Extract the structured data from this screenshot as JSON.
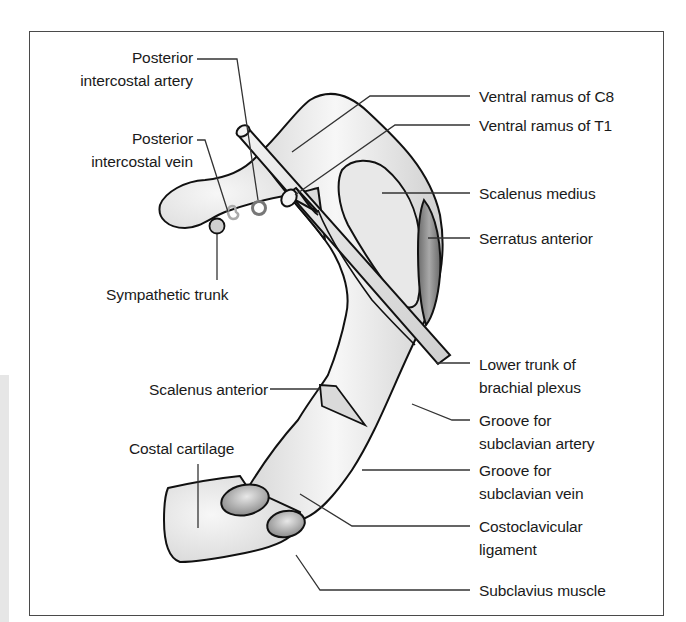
{
  "figure": {
    "colors": {
      "outline": "#111111",
      "bone_fill": "#e2e2e2",
      "bone_highlight": "#f6f6f6",
      "serratus_fill": "#8a8a8a",
      "ligament_fill": "#9a9a9a",
      "leader_line": "#333333",
      "frame": "#4a4a4a"
    },
    "labels_left": [
      {
        "id": "posterior-intercostal-artery",
        "lines": [
          "Posterior",
          "intercostal artery"
        ]
      },
      {
        "id": "posterior-intercostal-vein",
        "lines": [
          "Posterior",
          "intercostal vein"
        ]
      },
      {
        "id": "sympathetic-trunk",
        "lines": [
          "Sympathetic trunk"
        ]
      },
      {
        "id": "scalenus-anterior",
        "lines": [
          "Scalenus anterior"
        ]
      },
      {
        "id": "costal-cartilage",
        "lines": [
          "Costal cartilage"
        ]
      }
    ],
    "labels_right": [
      {
        "id": "ventral-ramus-c8",
        "lines": [
          "Ventral ramus of C8"
        ]
      },
      {
        "id": "ventral-ramus-t1",
        "lines": [
          "Ventral ramus of T1"
        ]
      },
      {
        "id": "scalenus-medius",
        "lines": [
          "Scalenus medius"
        ]
      },
      {
        "id": "serratus-anterior",
        "lines": [
          "Serratus anterior"
        ]
      },
      {
        "id": "lower-trunk-brachial-plexus",
        "lines": [
          "Lower trunk of",
          "brachial plexus"
        ]
      },
      {
        "id": "groove-subclavian-artery",
        "lines": [
          "Groove for",
          "subclavian artery"
        ]
      },
      {
        "id": "groove-subclavian-vein",
        "lines": [
          "Groove for",
          "subclavian vein"
        ]
      },
      {
        "id": "costoclavicular-ligament",
        "lines": [
          "Costoclavicular",
          "ligament"
        ]
      },
      {
        "id": "subclavius-muscle",
        "lines": [
          "Subclavius muscle"
        ]
      }
    ]
  }
}
